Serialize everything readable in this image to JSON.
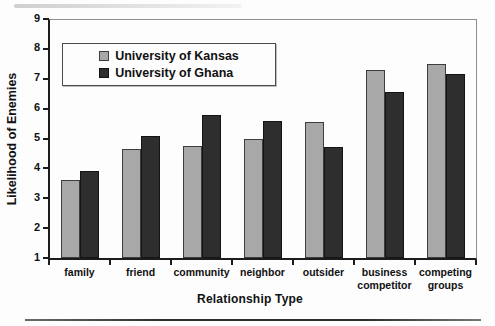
{
  "chart_data": {
    "type": "bar",
    "title": "",
    "xlabel": "Relationship Type",
    "ylabel": "Likelihood of Enemies",
    "ylim": [
      1,
      9
    ],
    "yticks": [
      1,
      2,
      3,
      4,
      5,
      6,
      7,
      8,
      9
    ],
    "grid": false,
    "legend_position": "top-left",
    "categories": [
      "family",
      "friend",
      "community",
      "neighbor",
      "outsider",
      "business competitor",
      "competing groups"
    ],
    "series": [
      {
        "name": "University of Kansas",
        "color": "#a8a8a8",
        "border_color": "#3d3d3d",
        "values": [
          3.6,
          4.65,
          4.75,
          5.0,
          5.55,
          7.3,
          7.5
        ]
      },
      {
        "name": "University of Ghana",
        "color": "#2e2e2e",
        "border_color": "#141414",
        "values": [
          3.9,
          5.1,
          5.8,
          5.6,
          4.7,
          6.55,
          7.15
        ]
      }
    ]
  }
}
